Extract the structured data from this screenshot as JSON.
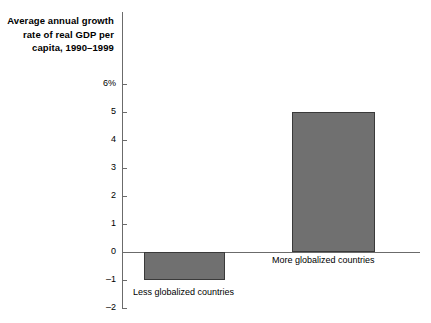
{
  "chart_data": {
    "type": "bar",
    "title": "Average annual growth rate of real GDP per capita, 1990–1999",
    "title_lines": [
      "Average annual growth",
      "rate of real GDP per",
      "capita, 1990–1999"
    ],
    "categories": [
      "Less globalized countries",
      "More globalized countries"
    ],
    "values": [
      -1,
      5
    ],
    "xlabel": "",
    "ylabel": "",
    "ylim": [
      -2,
      6
    ],
    "yticks": [
      {
        "value": 6,
        "label": "6%"
      },
      {
        "value": 5,
        "label": "5"
      },
      {
        "value": 4,
        "label": "4"
      },
      {
        "value": 3,
        "label": "3"
      },
      {
        "value": 2,
        "label": "2"
      },
      {
        "value": 1,
        "label": "1"
      },
      {
        "value": 0,
        "label": "0"
      },
      {
        "value": -1,
        "label": "–1"
      },
      {
        "value": -2,
        "label": "–2"
      }
    ],
    "grid": false,
    "legend": "none",
    "bar_color": "#707070",
    "bar_border_color": "#3a3a3a",
    "axis_color": "#6b6b6b",
    "background_color": "#ffffff",
    "units": "percent"
  }
}
